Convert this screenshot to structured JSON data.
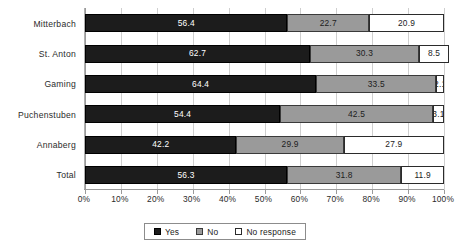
{
  "chart_data": {
    "type": "bar",
    "orientation": "horizontal",
    "stacked": true,
    "stack_mode": "percent",
    "title": "",
    "xlabel": "",
    "ylabel": "",
    "xlim": [
      0,
      100
    ],
    "grid": true,
    "legend_position": "bottom",
    "categories": [
      "Mitterbach",
      "St. Anton",
      "Gaming",
      "Puchenstuben",
      "Annaberg",
      "Total"
    ],
    "xticks": [
      "0%",
      "10%",
      "20%",
      "30%",
      "40%",
      "50%",
      "60%",
      "70%",
      "80%",
      "90%",
      "100%"
    ],
    "xtick_values": [
      0,
      10,
      20,
      30,
      40,
      50,
      60,
      70,
      80,
      90,
      100
    ],
    "series": [
      {
        "name": "Yes",
        "color": "#1c1c1c",
        "values": [
          56.4,
          62.7,
          64.4,
          54.4,
          42.2,
          56.3
        ]
      },
      {
        "name": "No",
        "color": "#9a9a9a",
        "values": [
          22.7,
          30.3,
          33.5,
          42.5,
          29.9,
          31.8
        ]
      },
      {
        "name": "No response",
        "color": "#ffffff",
        "values": [
          20.9,
          8.5,
          2.1,
          3.1,
          27.9,
          11.9
        ]
      }
    ],
    "rows": [
      {
        "category": "Mitterbach",
        "yes": "56.4",
        "no": "22.7",
        "no_response": "20.9"
      },
      {
        "category": "St. Anton",
        "yes": "62.7",
        "no": "30.3",
        "no_response": "8.5"
      },
      {
        "category": "Gaming",
        "yes": "64.4",
        "no": "33.5",
        "no_response": "2.1"
      },
      {
        "category": "Puchenstuben",
        "yes": "54.4",
        "no": "42.5",
        "no_response": "3.1"
      },
      {
        "category": "Annaberg",
        "yes": "42.2",
        "no": "29.9",
        "no_response": "27.9"
      },
      {
        "category": "Total",
        "yes": "56.3",
        "no": "31.8",
        "no_response": "11.9"
      }
    ]
  },
  "legend": {
    "items": [
      {
        "label": "Yes",
        "swatch": "yes"
      },
      {
        "label": "No",
        "swatch": "no"
      },
      {
        "label": "No response",
        "swatch": "noresp"
      }
    ]
  }
}
